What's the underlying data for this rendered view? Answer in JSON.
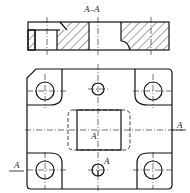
{
  "drawing": {
    "section_title": "A–A",
    "section_marker_left": "A",
    "section_marker_right": "A",
    "label_center": "A",
    "label_bottom_hole": "A"
  },
  "colors": {
    "line": "#111111",
    "background": "#ffffff"
  }
}
